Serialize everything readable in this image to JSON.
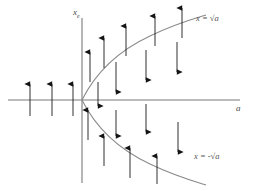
{
  "figure": {
    "type": "phase-diagram",
    "background_color": "#ffffff",
    "axis_color": "#7a7a7a",
    "curve_color": "#8a8a8a",
    "arrow_color": "#1a1a1a",
    "label_color": "#4a4a4a"
  },
  "axes": {
    "x_axis_label": "a",
    "y_axis_label_base": "x",
    "y_axis_label_sub": "e",
    "origin": {
      "x": 82,
      "y": 100
    },
    "x_axis_start": {
      "x": 8,
      "y": 100
    },
    "x_axis_end": {
      "x": 240,
      "y": 100
    },
    "y_axis_start": {
      "x": 82,
      "y": 18
    },
    "y_axis_end": {
      "x": 82,
      "y": 183
    }
  },
  "curves": [
    {
      "name": "upper-branch",
      "label": "x = √a",
      "label_math": "x = sqrt(a)",
      "label_position": {
        "x": 196,
        "y": 14
      },
      "path": "M 82 100 C 96 72, 120 50, 150 36 C 175 24, 196 18, 206 15"
    },
    {
      "name": "lower-branch",
      "label": "x = -√a",
      "label_math": "x = -sqrt(a)",
      "label_position": {
        "x": 196,
        "y": 153
      },
      "path": "M 82 100 C 96 128, 120 150, 150 164 C 175 176, 196 182, 206 185"
    }
  ],
  "arrows": [
    {
      "id": "a1",
      "direction": "up",
      "x": 30,
      "y_tail": 116,
      "y_head": 84,
      "region": "left-of-origin"
    },
    {
      "id": "a2",
      "direction": "up",
      "x": 52,
      "y_tail": 116,
      "y_head": 84,
      "region": "left-of-origin"
    },
    {
      "id": "a3",
      "direction": "up",
      "x": 73,
      "y_tail": 116,
      "y_head": 84,
      "region": "left-of-origin"
    },
    {
      "id": "a4",
      "direction": "up",
      "x": 90,
      "y_tail": 82,
      "y_head": 52,
      "region": "above-upper-branch"
    },
    {
      "id": "a5",
      "direction": "up",
      "x": 104,
      "y_tail": 68,
      "y_head": 38,
      "region": "above-upper-branch"
    },
    {
      "id": "a6",
      "direction": "up",
      "x": 126,
      "y_tail": 56,
      "y_head": 26,
      "region": "above-upper-branch"
    },
    {
      "id": "a7",
      "direction": "up",
      "x": 155,
      "y_tail": 46,
      "y_head": 16,
      "region": "above-upper-branch"
    },
    {
      "id": "a8",
      "direction": "up",
      "x": 182,
      "y_tail": 38,
      "y_head": 8,
      "region": "above-upper-branch"
    },
    {
      "id": "a9",
      "direction": "down",
      "x": 116,
      "y_tail": 62,
      "y_head": 92,
      "region": "between-branches-upper"
    },
    {
      "id": "a10",
      "direction": "down",
      "x": 146,
      "y_tail": 50,
      "y_head": 80,
      "region": "between-branches-upper"
    },
    {
      "id": "a11",
      "direction": "down",
      "x": 177,
      "y_tail": 42,
      "y_head": 72,
      "region": "between-branches-upper"
    },
    {
      "id": "a12",
      "direction": "down",
      "x": 98,
      "y_tail": 82,
      "y_head": 106,
      "region": "between-branches-upper"
    },
    {
      "id": "a13",
      "direction": "up",
      "x": 88,
      "y_tail": 140,
      "y_head": 110,
      "region": "between-branches-lower"
    },
    {
      "id": "a14",
      "direction": "down",
      "x": 116,
      "y_tail": 110,
      "y_head": 136,
      "region": "between-branches-lower"
    },
    {
      "id": "a15",
      "direction": "down",
      "x": 146,
      "y_tail": 104,
      "y_head": 132,
      "region": "between-branches-lower"
    },
    {
      "id": "a16",
      "direction": "down",
      "x": 178,
      "y_tail": 122,
      "y_head": 152,
      "region": "between-branches-lower"
    },
    {
      "id": "a17",
      "direction": "up",
      "x": 104,
      "y_tail": 166,
      "y_head": 136,
      "region": "below-lower-branch"
    },
    {
      "id": "a18",
      "direction": "up",
      "x": 130,
      "y_tail": 178,
      "y_head": 148,
      "region": "below-lower-branch"
    },
    {
      "id": "a19",
      "direction": "up",
      "x": 157,
      "y_tail": 184,
      "y_head": 156,
      "region": "below-lower-branch"
    }
  ]
}
